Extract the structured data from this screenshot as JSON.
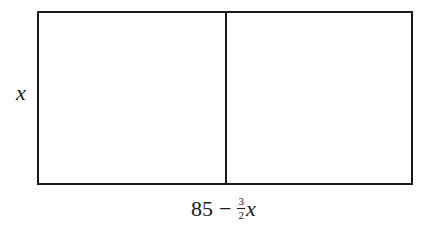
{
  "diagram": {
    "type": "rectangle-divided",
    "side_label": {
      "text": "x"
    },
    "bottom_label": {
      "constant": "85",
      "operator": "−",
      "fraction": {
        "numerator": "3",
        "denominator": "2"
      },
      "variable": "x",
      "full_text": "85 − (3/2)x"
    },
    "sections": 2,
    "colors": {
      "stroke": "#1a1a1a",
      "background": "#ffffff"
    }
  }
}
